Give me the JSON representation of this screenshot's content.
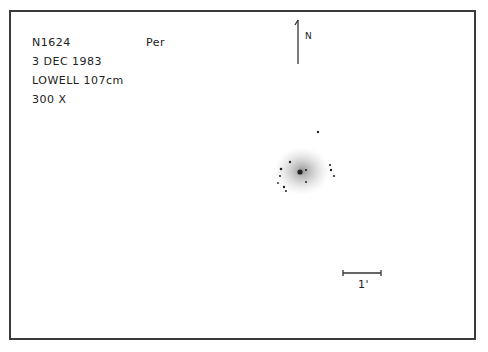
{
  "sketch": {
    "object": "N1624",
    "constellation": "Per",
    "date": "3 DEC 1983",
    "telescope": "LOWELL 107cm",
    "magnification": "300 X",
    "north_label": "N",
    "scale_label": "1'"
  },
  "colors": {
    "frame": "#3a3a3a",
    "ink": "#222222",
    "nebula": "#b8b8b8"
  }
}
